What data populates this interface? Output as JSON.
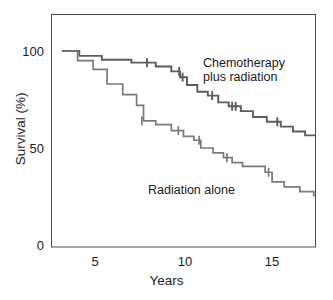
{
  "chart_data": {
    "type": "line",
    "subtype": "kaplan-meier-survival-step",
    "title": "",
    "xlabel": "Years",
    "ylabel": "Survival (%)",
    "xlim": [
      2.0,
      17.2
    ],
    "ylim": [
      0,
      105
    ],
    "xticks": [
      5,
      10,
      15
    ],
    "xtick_labels": [
      "5",
      "10",
      "15"
    ],
    "yticks": [
      0,
      50,
      100
    ],
    "ytick_labels": [
      "0",
      "50",
      "100"
    ],
    "grid": false,
    "legend_position": "inline-annotations",
    "frame": "box",
    "series": [
      {
        "name": "Chemotherapy plus radiation",
        "color": "#5c5c5c",
        "line_width": 1.9,
        "annotation": "Chemotherapy\nplus radiation",
        "points": [
          [
            2.6,
            100.0
          ],
          [
            3.6,
            100.0
          ],
          [
            3.6,
            97.5
          ],
          [
            4.9,
            97.5
          ],
          [
            4.9,
            95.5
          ],
          [
            6.6,
            95.5
          ],
          [
            6.6,
            94.0
          ],
          [
            8.0,
            94.0
          ],
          [
            8.0,
            92.0
          ],
          [
            8.9,
            92.0
          ],
          [
            8.9,
            89.5
          ],
          [
            9.4,
            89.5
          ],
          [
            9.4,
            86.5
          ],
          [
            9.8,
            86.5
          ],
          [
            9.8,
            82.5
          ],
          [
            10.4,
            82.5
          ],
          [
            10.4,
            79.0
          ],
          [
            11.0,
            79.0
          ],
          [
            11.0,
            77.0
          ],
          [
            11.6,
            77.0
          ],
          [
            11.6,
            73.5
          ],
          [
            12.2,
            73.5
          ],
          [
            12.2,
            71.5
          ],
          [
            12.9,
            71.5
          ],
          [
            12.9,
            69.0
          ],
          [
            13.6,
            69.0
          ],
          [
            13.6,
            66.0
          ],
          [
            14.4,
            66.0
          ],
          [
            14.4,
            63.5
          ],
          [
            15.2,
            63.5
          ],
          [
            15.2,
            61.0
          ],
          [
            15.9,
            61.0
          ],
          [
            15.9,
            58.5
          ],
          [
            16.6,
            58.5
          ],
          [
            16.6,
            56.5
          ],
          [
            17.2,
            56.5
          ]
        ],
        "censored": [
          [
            7.5,
            94.0
          ],
          [
            9.35,
            89.5
          ],
          [
            9.55,
            86.5
          ],
          [
            11.25,
            77.0
          ],
          [
            12.4,
            71.5
          ],
          [
            12.6,
            71.5
          ],
          [
            15.0,
            63.5
          ]
        ],
        "final_survival_percent": 56
      },
      {
        "name": "Radiation alone",
        "color": "#7a7a7a",
        "line_width": 1.7,
        "annotation": "Radiation alone",
        "points": [
          [
            2.6,
            100.0
          ],
          [
            3.5,
            100.0
          ],
          [
            3.5,
            95.0
          ],
          [
            4.4,
            95.0
          ],
          [
            4.4,
            90.5
          ],
          [
            5.2,
            90.5
          ],
          [
            5.2,
            83.0
          ],
          [
            6.1,
            83.0
          ],
          [
            6.1,
            77.5
          ],
          [
            6.9,
            77.5
          ],
          [
            6.9,
            72.0
          ],
          [
            7.3,
            72.0
          ],
          [
            7.3,
            64.0
          ],
          [
            8.0,
            64.0
          ],
          [
            8.0,
            62.0
          ],
          [
            8.9,
            62.0
          ],
          [
            8.9,
            59.0
          ],
          [
            9.6,
            59.0
          ],
          [
            9.6,
            56.0
          ],
          [
            10.2,
            56.0
          ],
          [
            10.2,
            54.0
          ],
          [
            10.6,
            54.0
          ],
          [
            10.6,
            50.0
          ],
          [
            11.3,
            50.0
          ],
          [
            11.3,
            47.5
          ],
          [
            11.9,
            47.5
          ],
          [
            11.9,
            45.0
          ],
          [
            12.4,
            45.0
          ],
          [
            12.4,
            42.5
          ],
          [
            13.0,
            42.5
          ],
          [
            13.0,
            40.5
          ],
          [
            14.3,
            40.5
          ],
          [
            14.3,
            37.5
          ],
          [
            14.7,
            37.5
          ],
          [
            14.7,
            32.5
          ],
          [
            15.4,
            32.5
          ],
          [
            15.4,
            30.0
          ],
          [
            16.3,
            30.0
          ],
          [
            16.3,
            27.5
          ],
          [
            17.1,
            27.5
          ],
          [
            17.1,
            25.0
          ]
        ],
        "censored": [
          [
            7.2,
            64.0
          ],
          [
            9.3,
            59.0
          ],
          [
            10.5,
            54.0
          ],
          [
            12.1,
            45.0
          ],
          [
            14.5,
            37.5
          ]
        ],
        "final_survival_percent": 25
      }
    ]
  },
  "axes": {
    "y_label": "Survival (%)",
    "x_label": "Years",
    "y_ticks": [
      {
        "value": 100,
        "label": "100"
      },
      {
        "value": 50,
        "label": "50"
      },
      {
        "value": 0,
        "label": "0"
      }
    ],
    "x_ticks": [
      {
        "value": 5,
        "label": "5"
      },
      {
        "value": 10,
        "label": "10"
      },
      {
        "value": 15,
        "label": "15"
      }
    ]
  },
  "annotations": {
    "upper_curve_line1": "Chemotherapy",
    "upper_curve_line2": "plus radiation",
    "lower_curve": "Radiation alone"
  },
  "colors": {
    "background": "#ffffff",
    "frame": "#4a4a4a",
    "text": "#1a1a1a",
    "upper_curve": "#5c5c5c",
    "lower_curve": "#7a7a7a"
  }
}
